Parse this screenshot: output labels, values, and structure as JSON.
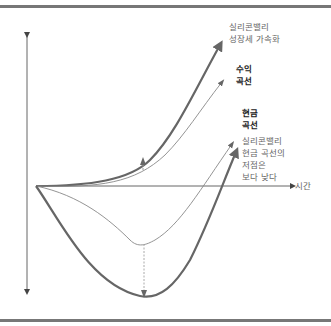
{
  "diagram": {
    "y_axis": {
      "direction": "both"
    },
    "x_axis": {
      "label": "시간"
    },
    "curves": [
      {
        "id": "sv-growth",
        "label_lines": [
          "실리콘밸리",
          "성장세 가속화"
        ],
        "style": "thick"
      },
      {
        "id": "revenue",
        "label_lines": [
          "수익",
          "곡선"
        ],
        "style": "thin",
        "bold_label": true
      },
      {
        "id": "cash",
        "label_lines": [
          "현금",
          "곡선"
        ],
        "style": "thin",
        "bold_label": true
      },
      {
        "id": "sv-cash",
        "label_lines": [
          "실리콘밸리",
          "현금 곡선의",
          "저점은",
          "보다 낮다"
        ],
        "style": "thick"
      }
    ],
    "annotations": [
      {
        "type": "dashed-arrow",
        "meaning": "growth acceleration gap"
      },
      {
        "type": "dashed-arrow",
        "meaning": "deeper cash trough"
      }
    ]
  },
  "colors": {
    "thick_line": "#666666",
    "thin_line": "#888888",
    "frame": "#777777"
  }
}
